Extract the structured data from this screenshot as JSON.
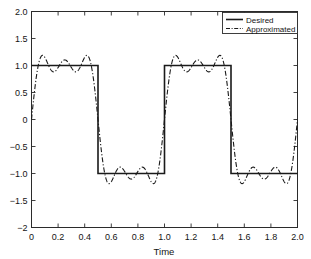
{
  "figure": {
    "background": "#ffffff",
    "axis_color": "#2b2b2b",
    "series_color": "#1a1a1a"
  },
  "chart_data": {
    "type": "line",
    "title": "",
    "xlabel": "Time",
    "ylabel": "",
    "xlim": [
      0,
      2.0
    ],
    "ylim": [
      -2,
      2.0
    ],
    "grid": false,
    "legend_position": "top-right",
    "xticks": [
      0,
      0.2,
      0.4,
      0.6,
      0.8,
      1.0,
      1.2,
      1.4,
      1.6,
      1.8,
      2.0
    ],
    "xtick_labels": [
      "0",
      "0.2",
      "0.4",
      "0.6",
      "0.8",
      "1.0",
      "1.2",
      "1.4",
      "1.6",
      "1.8",
      "2.0"
    ],
    "yticks": [
      2.0,
      1.5,
      1.0,
      0.5,
      0,
      -0.5,
      -1.0,
      -1.5,
      -2
    ],
    "ytick_labels": [
      "2.0",
      "1.5",
      "1.0",
      "0.5",
      "0",
      "-0.5",
      "-1.0",
      "-1.5",
      "-2"
    ],
    "series": [
      {
        "name": "Desired",
        "style": "solid",
        "width": 1.6,
        "color": "#1a1a1a",
        "description": "Square wave, period 1.0, amplitude 1, high on [0,0.5) and [1.0,1.5), low on [0.5,1.0) and [1.5,2.0]",
        "points": [
          [
            0.0,
            1.0
          ],
          [
            0.5,
            1.0
          ],
          [
            0.5,
            -1.0
          ],
          [
            1.0,
            -1.0
          ],
          [
            1.0,
            1.0
          ],
          [
            1.5,
            1.0
          ],
          [
            1.5,
            -1.0
          ],
          [
            2.0,
            -1.0
          ]
        ]
      },
      {
        "name": "Approximated",
        "style": "dashdot",
        "width": 1.1,
        "color": "#1a1a1a",
        "description": "Truncated Fourier sine series of the square wave (first 3 odd harmonics), showing Gibbs overshoot to about +/-1.4",
        "harmonics": [
          {
            "n": 1,
            "amplitude": 1.2732
          },
          {
            "n": 3,
            "amplitude": 0.4244
          },
          {
            "n": 5,
            "amplitude": 0.2546
          }
        ],
        "fundamental_period": 1.0,
        "key_points": [
          [
            0.0,
            -0.4
          ],
          [
            0.05,
            0.25
          ],
          [
            0.1,
            0.75
          ],
          [
            0.15,
            0.99
          ],
          [
            0.2,
            0.95
          ],
          [
            0.25,
            0.85
          ],
          [
            0.3,
            0.94
          ],
          [
            0.35,
            1.22
          ],
          [
            0.4,
            1.4
          ],
          [
            0.45,
            1.27
          ],
          [
            0.5,
            0.0
          ],
          [
            0.55,
            -1.27
          ],
          [
            0.6,
            -1.4
          ],
          [
            0.65,
            -1.22
          ],
          [
            0.7,
            -0.94
          ],
          [
            0.75,
            -0.85
          ],
          [
            0.8,
            -0.95
          ],
          [
            0.85,
            -0.99
          ],
          [
            0.9,
            -1.4
          ],
          [
            0.95,
            -1.1
          ],
          [
            1.0,
            0.0
          ],
          [
            1.05,
            0.6
          ],
          [
            1.1,
            0.95
          ],
          [
            1.15,
            1.02
          ],
          [
            1.2,
            0.86
          ],
          [
            1.25,
            0.8
          ],
          [
            1.3,
            0.95
          ],
          [
            1.35,
            1.24
          ],
          [
            1.4,
            1.41
          ],
          [
            1.45,
            1.22
          ],
          [
            1.5,
            0.0
          ],
          [
            1.55,
            -1.22
          ],
          [
            1.6,
            -1.41
          ],
          [
            1.65,
            -1.0
          ],
          [
            1.7,
            -0.88
          ],
          [
            1.75,
            -0.8
          ],
          [
            1.8,
            -0.95
          ],
          [
            1.85,
            -1.1
          ],
          [
            1.9,
            -1.4
          ],
          [
            1.95,
            -1.05
          ],
          [
            2.0,
            -0.4
          ]
        ]
      }
    ],
    "annotations": []
  },
  "legend": {
    "entries": [
      {
        "label": "Desired",
        "style": "solid"
      },
      {
        "label": "Approximated",
        "style": "dashdot"
      }
    ]
  }
}
